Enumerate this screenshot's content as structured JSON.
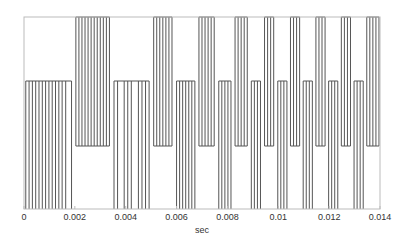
{
  "chart_data": {
    "type": "line",
    "title": "",
    "xlabel": "sec",
    "ylabel": "",
    "xlim": [
      0,
      0.014
    ],
    "xticks": [
      0,
      0.002,
      0.004,
      0.006,
      0.008,
      0.01,
      0.012,
      0.014
    ],
    "xtick_labels": [
      "0",
      "0.002",
      "0.004",
      "0.006",
      "0.008",
      "0.01",
      "0.012",
      "0.014"
    ],
    "levels": {
      "top": 1,
      "mid": 0.33,
      "low": -0.33,
      "bottom": -1
    },
    "grid": false,
    "legend": null,
    "segments": [
      {
        "band": "bottom-mid",
        "pulses": [
          5e-05,
          0.00018,
          0.00031,
          0.00044,
          0.00057,
          0.0007,
          0.00083,
          0.00096,
          0.00109,
          0.00122,
          0.00135,
          0.00148,
          0.00162,
          0.00185
        ]
      },
      {
        "band": "low-top",
        "pulses": [
          0.00202,
          0.00214,
          0.00226,
          0.00238,
          0.0025,
          0.00262,
          0.00274,
          0.00286,
          0.00298,
          0.0031,
          0.00322,
          0.00334
        ]
      },
      {
        "band": "bottom-mid",
        "pulses": [
          0.00352,
          0.00366,
          0.00392,
          0.00406,
          0.0042,
          0.00448,
          0.00462,
          0.00476,
          0.0049
        ]
      },
      {
        "band": "low-top",
        "pulses": [
          0.00508,
          0.0052,
          0.00532,
          0.00544,
          0.00556,
          0.00568,
          0.0058
        ]
      },
      {
        "band": "bottom-mid",
        "pulses": [
          0.00598,
          0.0061,
          0.00622,
          0.00634,
          0.00646,
          0.00658,
          0.0067
        ]
      },
      {
        "band": "low-top",
        "pulses": [
          0.00686,
          0.00698,
          0.0071,
          0.00722,
          0.00734,
          0.00746
        ]
      },
      {
        "band": "bottom-mid",
        "pulses": [
          0.00764,
          0.00776,
          0.00788,
          0.008,
          0.00812
        ]
      },
      {
        "band": "low-top",
        "pulses": [
          0.00828,
          0.0084,
          0.00852,
          0.00864,
          0.00876
        ]
      },
      {
        "band": "bottom-mid",
        "pulses": [
          0.00892,
          0.00904,
          0.00916,
          0.00928
        ]
      },
      {
        "band": "low-top",
        "pulses": [
          0.00944,
          0.00956,
          0.00968,
          0.0098
        ]
      },
      {
        "band": "bottom-mid",
        "pulses": [
          0.00996,
          0.01008,
          0.0102,
          0.01032
        ]
      },
      {
        "band": "low-top",
        "pulses": [
          0.01046,
          0.01058,
          0.0107,
          0.01082
        ]
      },
      {
        "band": "bottom-mid",
        "pulses": [
          0.01096,
          0.01108,
          0.0112,
          0.01132
        ]
      },
      {
        "band": "low-top",
        "pulses": [
          0.01146,
          0.01158,
          0.0117,
          0.01182
        ]
      },
      {
        "band": "bottom-mid",
        "pulses": [
          0.01196,
          0.01208,
          0.0122,
          0.01232
        ]
      },
      {
        "band": "low-top",
        "pulses": [
          0.01246,
          0.01258,
          0.0127,
          0.01282
        ]
      },
      {
        "band": "bottom-mid",
        "pulses": [
          0.01296,
          0.01308,
          0.0132,
          0.01332
        ]
      },
      {
        "band": "low-top",
        "pulses": [
          0.01346,
          0.01358,
          0.0137,
          0.01382,
          0.01394
        ]
      }
    ]
  },
  "layout": {
    "plot_left": 24,
    "plot_right": 380,
    "plot_top": 17,
    "plot_bottom": 209,
    "y_mid": 81,
    "y_low": 146,
    "line_color": "#555555",
    "frame_color": "#bbbbbb"
  }
}
